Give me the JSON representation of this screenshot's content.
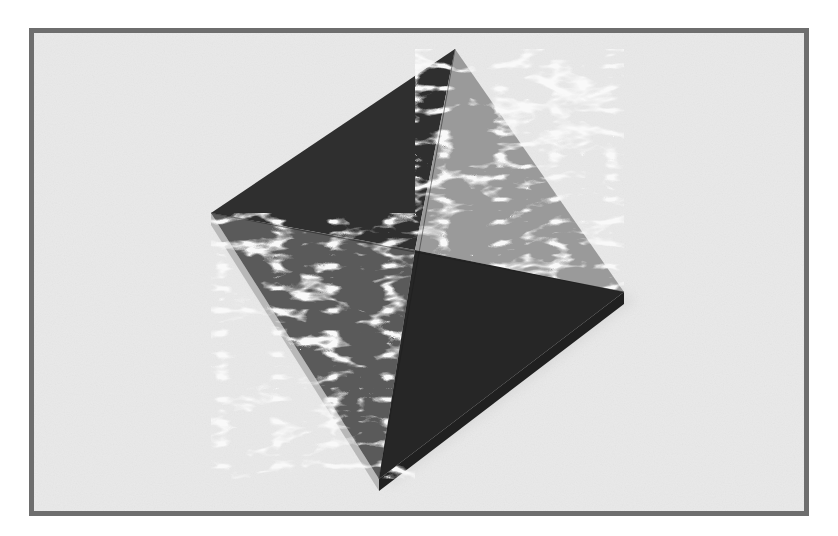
{
  "image": {
    "subject": "origami-square-box",
    "description": "Photograph of a square origami box rotated ~34deg on a light gray textured surface; two opposite lid triangles dark charcoal, two opposite triangles in white/gray marbled paper",
    "size": {
      "width": 838,
      "height": 536
    }
  },
  "frame": {
    "x": 34,
    "y": 33,
    "width": 770,
    "height": 478,
    "border_width": 5,
    "border_color": "#6e6e6e",
    "fill_color": "#e9e9e9",
    "page_background": "#ffffff"
  },
  "box": {
    "vertices": {
      "top": [
        455,
        49
      ],
      "right": [
        624,
        292
      ],
      "bottom": [
        379,
        479
      ],
      "left": [
        211,
        213
      ],
      "center": [
        415,
        250
      ]
    },
    "side_depth": 12,
    "colors": {
      "dark_panel": "#2f2f2f",
      "dark_panel_shade": "#262626",
      "side_dark": "#202020",
      "marble_base": "#f2f2f2",
      "marble_mid": "#9a9a9a",
      "marble_dark": "#5a5a5a",
      "side_light": "#b8b8b8",
      "shadow": "#cfcfcf"
    }
  }
}
